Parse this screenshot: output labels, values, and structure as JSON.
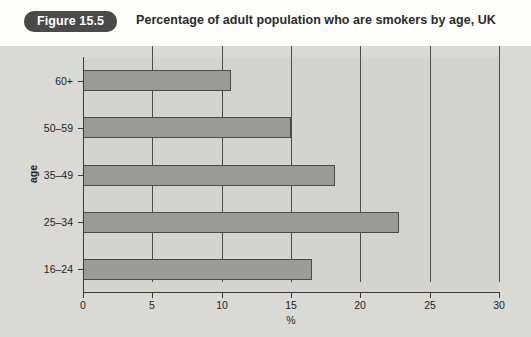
{
  "header": {
    "badge_label": "Figure 15.5",
    "title": "Percentage of adult population who are smokers by age, UK"
  },
  "colors": {
    "badge_background": "#4a4a4a",
    "badge_text": "#ffffff",
    "panel_background": "#d9d9d6",
    "plot_background": "#d3d3d0",
    "bar_fill": "#9a9a96",
    "bar_border": "#4a4a4a",
    "axis": "#3a3a3a",
    "gridline": "#4c4c4c",
    "text": "#1f1f1f"
  },
  "chart_data": {
    "type": "bar",
    "orientation": "horizontal",
    "title": "Percentage of adult population who are smokers by age, UK",
    "xlabel": "%",
    "ylabel": "age",
    "categories": [
      "16–24",
      "25–34",
      "35–49",
      "50–59",
      "60+"
    ],
    "values": [
      16.5,
      22.8,
      18.2,
      15.0,
      10.7
    ],
    "xlim": [
      0,
      30
    ],
    "xticks": [
      0,
      5,
      10,
      15,
      20,
      25,
      30
    ],
    "xtick_labels": [
      "0",
      "5",
      "10",
      "15",
      "20",
      "25",
      "30"
    ],
    "ytick_labels": [
      "16–24",
      "25–34",
      "35–49",
      "50–59",
      "60+"
    ],
    "grid": "vertical",
    "legend": "none",
    "series": [
      {
        "name": "Percentage who are smokers",
        "values": [
          16.5,
          22.8,
          18.2,
          15.0,
          10.7
        ]
      }
    ]
  }
}
